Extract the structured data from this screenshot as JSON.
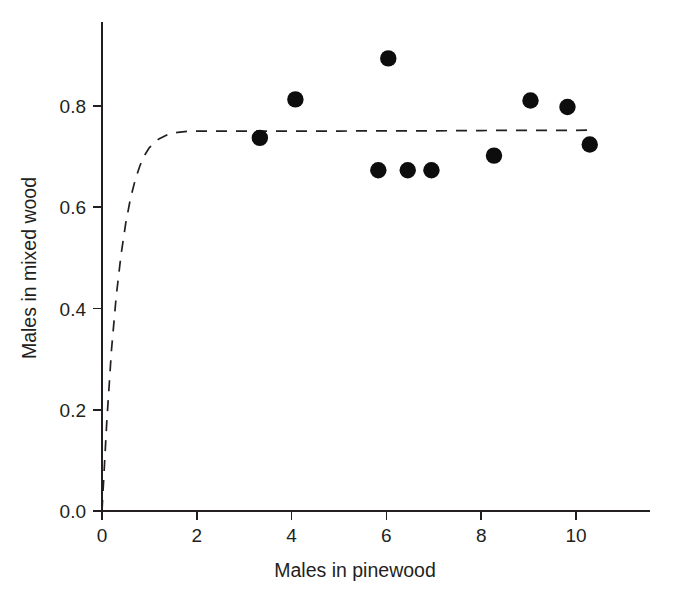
{
  "chart_data": {
    "type": "scatter",
    "title": "",
    "subtitle": "",
    "xlabel": "Males in pinewood",
    "ylabel": "Males in mixed wood",
    "xlim": [
      0,
      11.55
    ],
    "ylim": [
      0,
      0.97
    ],
    "grid": false,
    "legend": null,
    "xticks": [
      0,
      2,
      4,
      6,
      8,
      10
    ],
    "xtick_labels": [
      "0",
      "2",
      "4",
      "6",
      "8",
      "10"
    ],
    "yticks": [
      0.0,
      0.2,
      0.4,
      0.6,
      0.8
    ],
    "ytick_labels": [
      "0.0",
      "0.2",
      "0.4",
      "0.6",
      "0.8"
    ],
    "points": [
      {
        "x": 3.33,
        "y": 0.737
      },
      {
        "x": 4.08,
        "y": 0.813
      },
      {
        "x": 5.83,
        "y": 0.673
      },
      {
        "x": 6.04,
        "y": 0.894
      },
      {
        "x": 6.45,
        "y": 0.673
      },
      {
        "x": 6.95,
        "y": 0.673
      },
      {
        "x": 8.27,
        "y": 0.702
      },
      {
        "x": 9.04,
        "y": 0.811
      },
      {
        "x": 9.82,
        "y": 0.798
      },
      {
        "x": 10.29,
        "y": 0.724
      }
    ],
    "series": [
      {
        "name": "observed",
        "style": "filled-circle",
        "color": "#0d0d0d",
        "x": [
          3.33,
          4.08,
          5.83,
          6.04,
          6.45,
          6.95,
          8.27,
          9.04,
          9.82,
          10.29
        ],
        "values": [
          0.737,
          0.813,
          0.673,
          0.894,
          0.673,
          0.673,
          0.702,
          0.811,
          0.798,
          0.724
        ]
      },
      {
        "name": "fitted-curve",
        "style": "dashed-line",
        "color": "#231f20",
        "asymptote": 0.752,
        "x": [
          0.0,
          0.1,
          0.2,
          0.3,
          0.4,
          0.5,
          0.6,
          0.7,
          0.8,
          0.9,
          1.0,
          1.2,
          1.4,
          1.6,
          1.8,
          2.0,
          2.5,
          3.0,
          4.0,
          5.0,
          6.0,
          7.0,
          8.0,
          9.0,
          10.0,
          10.4
        ],
        "values": [
          0.0,
          0.175,
          0.318,
          0.424,
          0.505,
          0.568,
          0.617,
          0.654,
          0.682,
          0.703,
          0.718,
          0.735,
          0.744,
          0.748,
          0.75,
          0.7505,
          0.7505,
          0.7505,
          0.7505,
          0.7505,
          0.751,
          0.751,
          0.7515,
          0.752,
          0.752,
          0.7525
        ]
      }
    ]
  },
  "geometry": {
    "origin_x": 102,
    "origin_y": 511,
    "x_unit_px": 47.4,
    "y_unit_px": 506.25,
    "x_axis_end": 650,
    "y_axis_top": 22,
    "point_radius": 8.2
  }
}
